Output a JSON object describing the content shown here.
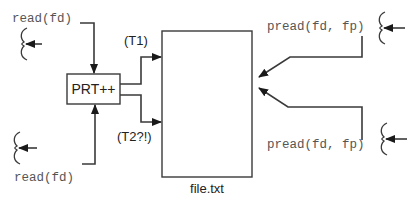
{
  "diagram": {
    "file_box": {
      "label": "file.txt"
    },
    "prt_box": {
      "label": "PRT++"
    },
    "branches": {
      "t1": "(T1)",
      "t2": "(T2?!)"
    },
    "left_calls": [
      {
        "label": "read(fd)",
        "position": "top-left"
      },
      {
        "label": "read(fd)",
        "position": "bottom-left"
      }
    ],
    "right_calls": [
      {
        "label": "pread(fd, fp)",
        "position": "top-right"
      },
      {
        "label": "pread(fd, fp)",
        "position": "bottom-right"
      }
    ],
    "colors": {
      "line": "#3a3a3a",
      "text_mono": "#555555",
      "text_sans": "#222222",
      "background": "#ffffff"
    }
  }
}
